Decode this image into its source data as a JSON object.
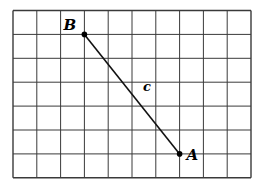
{
  "diagram": {
    "grid": {
      "cols": 10,
      "rows": 7,
      "left": 13,
      "top": 10.5,
      "cell_w": 23.8,
      "cell_h": 23.9,
      "line_color": "#3a3a3a"
    },
    "points": [
      {
        "label": "B",
        "grid_x": 3,
        "grid_y": 1
      },
      {
        "label": "A",
        "grid_x": 7,
        "grid_y": 6
      }
    ],
    "segment": {
      "from": "B",
      "to": "A",
      "label": "c"
    },
    "colors": {
      "line": "#111111",
      "point": "#000000"
    }
  }
}
